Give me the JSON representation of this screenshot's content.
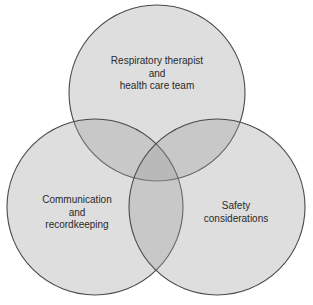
{
  "diagram": {
    "type": "venn",
    "colors": {
      "fill": "#9a9a9a",
      "fill_opacity": 0.33,
      "stroke": "#4a4a4a",
      "text": "#2a2a2a",
      "background": "#ffffff"
    },
    "sets": [
      {
        "id": "top",
        "lines": [
          "Respiratory therapist",
          "and",
          "health care team"
        ],
        "circle": {
          "cx": 157,
          "cy": 93,
          "r": 88
        }
      },
      {
        "id": "left",
        "lines": [
          "Communication",
          "and",
          "recordkeeping"
        ],
        "circle": {
          "cx": 95,
          "cy": 207,
          "r": 88
        }
      },
      {
        "id": "right",
        "lines": [
          "Safety",
          "considerations"
        ],
        "circle": {
          "cx": 217,
          "cy": 207,
          "r": 88
        }
      }
    ]
  }
}
